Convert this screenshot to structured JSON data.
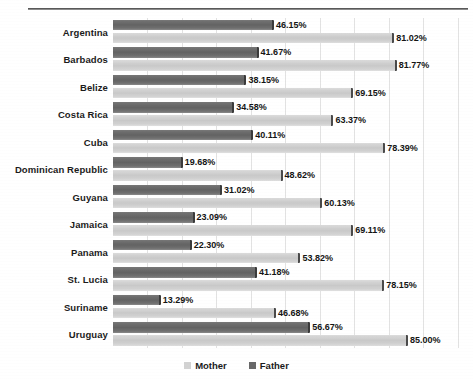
{
  "chart_data": {
    "type": "bar",
    "orientation": "horizontal",
    "title": "",
    "xlabel": "",
    "ylabel": "",
    "xlim": [
      0,
      100
    ],
    "grid": true,
    "gridline_values": [
      0,
      10,
      20,
      30,
      40,
      50,
      60,
      70,
      80,
      90,
      100
    ],
    "legend_position": "bottom-center",
    "value_suffix": "%",
    "categories": [
      "Argentina",
      "Barbados",
      "Belize",
      "Costa Rica",
      "Cuba",
      "Dominican Republic",
      "Guyana",
      "Jamaica",
      "Panama",
      "St. Lucia",
      "Suriname",
      "Uruguay"
    ],
    "series": [
      {
        "name": "Father",
        "color": "#686868",
        "values": [
          46.15,
          41.67,
          38.15,
          34.58,
          40.11,
          19.68,
          31.02,
          23.09,
          22.3,
          41.18,
          13.29,
          56.67
        ],
        "labels": [
          "46.15%",
          "41.67%",
          "38.15%",
          "34.58%",
          "40.11%",
          "19.68%",
          "31.02%",
          "23.09%",
          "22.30%",
          "41.18%",
          "13.29%",
          "56.67%"
        ]
      },
      {
        "name": "Mother",
        "color": "#d2d2d2",
        "values": [
          81.02,
          81.77,
          69.15,
          63.37,
          78.39,
          48.62,
          60.13,
          69.11,
          53.82,
          78.15,
          46.68,
          85.0
        ],
        "labels": [
          "81.02%",
          "81.77%",
          "69.15%",
          "63.37%",
          "78.39%",
          "48.62%",
          "60.13%",
          "69.11%",
          "53.82%",
          "78.15%",
          "46.68%",
          "85.00%"
        ]
      }
    ]
  },
  "legend": {
    "items": [
      {
        "label": "Mother",
        "key": "mother"
      },
      {
        "label": "Father",
        "key": "father"
      }
    ]
  }
}
